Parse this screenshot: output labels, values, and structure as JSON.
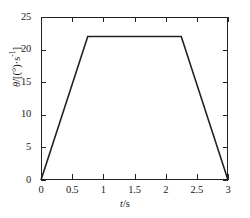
{
  "chart_data": {
    "type": "line",
    "title": "",
    "subtitle": "",
    "xlabel": "t/s",
    "xlabel_italic": "t",
    "xlabel_rest": "/s",
    "ylabel": "θ̇/[(°)·s⁻¹]",
    "ylabel_symbol": "θ̇",
    "ylabel_units": "/[(°)·s",
    "ylabel_exp": "-1",
    "ylabel_close": "]",
    "xlim": [
      0,
      3
    ],
    "ylim": [
      0,
      25
    ],
    "xticks": [
      0,
      0.5,
      1,
      1.5,
      2,
      2.5,
      3
    ],
    "xticklabels": [
      "0",
      "0.5",
      "1",
      "1.5",
      "2",
      "2.5",
      "3"
    ],
    "yticks": [
      0,
      5,
      10,
      15,
      20,
      25
    ],
    "yticklabels": [
      "0",
      "5",
      "10",
      "15",
      "20",
      "25"
    ],
    "grid": false,
    "legend": null,
    "legend_position": "none",
    "line_color": "#222222",
    "line_width": 1.6,
    "series": [
      {
        "name": "angular velocity profile",
        "x": [
          0,
          0.75,
          2.25,
          3
        ],
        "y": [
          0,
          22,
          22,
          0
        ]
      }
    ],
    "annotations": {
      "plateau_value": 22,
      "ramp_up_end_time": 0.75,
      "ramp_down_start_time": 2.25,
      "total_time": 3
    }
  }
}
